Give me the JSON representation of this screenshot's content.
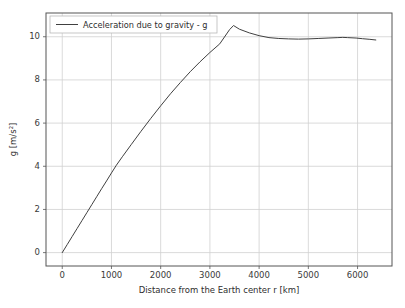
{
  "figure": {
    "background_color": "#ffffff",
    "plot_background_color": "#ffffff",
    "spine_color": "#555555",
    "grid_color": "#d0d0d0",
    "text_color": "#2e2e2e"
  },
  "chart_data": {
    "type": "line",
    "title": "",
    "xlabel": "Distance from the Earth center r [km]",
    "ylabel": "g [m/s²]",
    "xlim": [
      -330,
      6700
    ],
    "ylim": [
      -0.62,
      11.1
    ],
    "xticks": [
      0,
      1000,
      2000,
      3000,
      4000,
      5000,
      6000
    ],
    "xtick_labels": [
      "0",
      "1000",
      "2000",
      "3000",
      "4000",
      "5000",
      "6000"
    ],
    "yticks": [
      0,
      2,
      4,
      6,
      8,
      10
    ],
    "ytick_labels": [
      "0",
      "2",
      "4",
      "6",
      "8",
      "10"
    ],
    "grid": true,
    "legend_position": "upper left",
    "series": [
      {
        "name": "Acceleration due to gravity - g",
        "color": "#404040",
        "linewidth": 1.0,
        "x": [
          0,
          100,
          200,
          300,
          400,
          500,
          600,
          700,
          800,
          900,
          1000,
          1100,
          1221,
          1400,
          1600,
          1800,
          2000,
          2200,
          2400,
          2600,
          2800,
          3000,
          3200,
          3400,
          3480,
          3600,
          3800,
          4000,
          4200,
          4400,
          4600,
          4800,
          5000,
          5200,
          5400,
          5600,
          5700,
          5800,
          5971,
          6100,
          6250,
          6371
        ],
        "y": [
          0.0,
          0.37,
          0.74,
          1.11,
          1.48,
          1.85,
          2.22,
          2.59,
          2.96,
          3.32,
          3.69,
          4.05,
          4.44,
          5.0,
          5.62,
          6.22,
          6.8,
          7.36,
          7.88,
          8.38,
          8.84,
          9.27,
          9.67,
          10.33,
          10.52,
          10.35,
          10.18,
          10.05,
          9.96,
          9.92,
          9.9,
          9.89,
          9.9,
          9.92,
          9.94,
          9.96,
          9.97,
          9.96,
          9.94,
          9.91,
          9.88,
          9.85
        ]
      }
    ],
    "legend_entries": [
      "Acceleration due to gravity - g"
    ]
  },
  "layout": {
    "axes_left": 46,
    "axes_top": 13,
    "axes_right": 392,
    "axes_bottom": 266
  }
}
